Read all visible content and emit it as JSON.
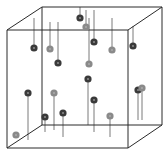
{
  "figure": {
    "type": "3d-scatter-cube",
    "background": "#ffffff",
    "edge_color": "#2a2a2a",
    "stem_color": "#7a7a7a",
    "colors": {
      "dark": "#3a3a3a",
      "gray": "#8a8a8a"
    }
  },
  "cube": {
    "back": {
      "tl": [
        42,
        7
      ],
      "tr": [
        162,
        7
      ],
      "bl": [
        42,
        125
      ],
      "br": [
        162,
        125
      ]
    },
    "front": {
      "tl": [
        7,
        30
      ],
      "tr": [
        128,
        30
      ],
      "bl": [
        7,
        148
      ],
      "br": [
        128,
        148
      ]
    }
  },
  "points": [
    {
      "x": 80,
      "y": 18,
      "shade": "dark",
      "stem_to": 7
    },
    {
      "x": 86,
      "y": 27,
      "shade": "gray",
      "stem_to": 10
    },
    {
      "x": 94,
      "y": 42,
      "shade": "dark",
      "stem_to": 10
    },
    {
      "x": 34,
      "y": 48,
      "shade": "dark",
      "stem_to": 18
    },
    {
      "x": 50,
      "y": 49,
      "shade": "gray",
      "stem_to": 22
    },
    {
      "x": 58,
      "y": 63,
      "shade": "dark",
      "stem_to": 22
    },
    {
      "x": 112,
      "y": 50,
      "shade": "gray",
      "stem_to": 18
    },
    {
      "x": 133,
      "y": 46,
      "shade": "dark",
      "stem_to": 26
    },
    {
      "x": 89,
      "y": 64,
      "shade": "gray",
      "stem_to": 18
    },
    {
      "x": 88,
      "y": 79,
      "shade": "dark",
      "stem_to": 125
    },
    {
      "x": 138,
      "y": 90,
      "shade": "dark",
      "stem_to": 120
    },
    {
      "x": 142,
      "y": 88,
      "shade": "gray",
      "stem_to": 120
    },
    {
      "x": 28,
      "y": 93,
      "shade": "dark",
      "stem_to": 140
    },
    {
      "x": 54,
      "y": 93,
      "shade": "gray",
      "stem_to": 130
    },
    {
      "x": 45,
      "y": 117,
      "shade": "dark",
      "stem_to": 132
    },
    {
      "x": 63,
      "y": 113,
      "shade": "dark",
      "stem_to": 137
    },
    {
      "x": 94,
      "y": 100,
      "shade": "dark",
      "stem_to": 132
    },
    {
      "x": 110,
      "y": 116,
      "shade": "gray",
      "stem_to": 137
    },
    {
      "x": 16,
      "y": 135,
      "shade": "gray",
      "stem_to": 135
    }
  ]
}
